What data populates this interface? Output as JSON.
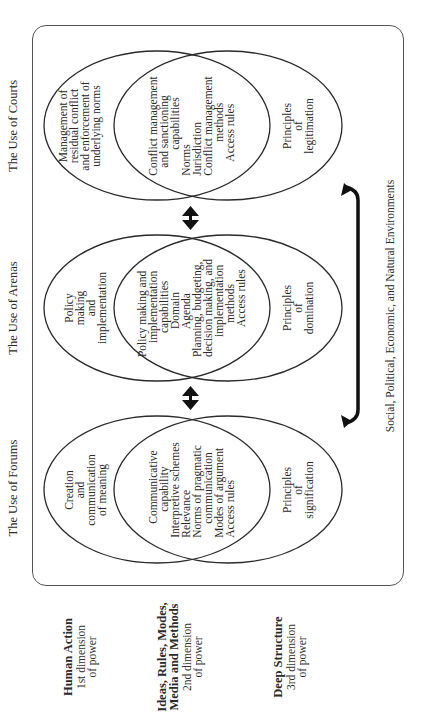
{
  "figure": {
    "columns": [
      {
        "title": "The Use of Forums",
        "outer_top": "Creation\nand\ncommunication\nof meaning",
        "overlap": [
          "Communicative",
          "capability",
          "Interpretive schemes",
          "Relevance",
          "Norms of pragmatic",
          "communication",
          "Modes of argument",
          "Access rules"
        ],
        "outer_bottom": "Principles\nof\nsignification"
      },
      {
        "title": "The Use of Arenas",
        "outer_top": "Policy\nmaking\nand\nimplementation",
        "overlap": [
          "Policy making and",
          "implementation",
          "capabilities",
          "Domain",
          "Agenda",
          "Planning, budgeting,",
          "decision making, and",
          "implementation",
          "methods",
          "Access rules"
        ],
        "outer_bottom": "Principles\nof\ndomination"
      },
      {
        "title": "The Use of Courts",
        "outer_top": "Management of\nresidual conflict\nand enforcement of\nunderlying norms",
        "overlap": [
          "Conflict management",
          "and sanctioning",
          "capabilities",
          "Norms",
          "Jurisdiction",
          "Conflict management",
          "methods",
          "Access rules"
        ],
        "outer_bottom": "Principles\nof\nlegitimation"
      }
    ],
    "environment_label": "Social, Political, Economic, and Natural Environments",
    "dimensions": [
      {
        "heading": "Human Action",
        "sub": "1st dimension\nof power"
      },
      {
        "heading": "Ideas, Rules, Modes,\nMedia and Methods",
        "sub": "2nd dimension\nof power"
      },
      {
        "heading": "Deep Structure",
        "sub": "3rd dimension\nof power"
      }
    ],
    "colors": {
      "line": "#2a2a2a",
      "frame": "#555555",
      "background": "#ffffff"
    }
  }
}
